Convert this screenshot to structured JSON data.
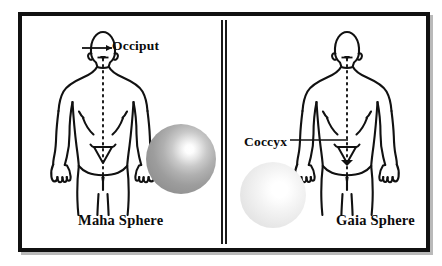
{
  "image": {
    "title": "Maha Sphere and Gaia Sphere anatomical reference",
    "background_color": "#ffffff",
    "frame_color": "#111111"
  },
  "panels": [
    {
      "id": "left",
      "caption": "Maha Sphere",
      "annotation": {
        "label": "Occiput",
        "icon": "leader-line-icon",
        "target": "base of skull / occiput"
      },
      "sphere": {
        "name": "maha-sphere",
        "tone": "medium gray",
        "fill_start": "#ffffff",
        "fill_end": "#8e8e8e",
        "highlight_position": "upper-right"
      },
      "figure": {
        "name": "human-back-figure",
        "view": "posterior",
        "midline": "dotted vertical spine line"
      }
    },
    {
      "id": "right",
      "caption": "Gaia Sphere",
      "annotation": {
        "label": "Coccyx",
        "icon": "leader-line-icon",
        "target": "sacrum / coccyx"
      },
      "sphere": {
        "name": "gaia-sphere",
        "tone": "pale light gray",
        "fill_start": "#ffffff",
        "fill_end": "#e1e1e1",
        "highlight_position": "center-right"
      },
      "figure": {
        "name": "human-back-figure",
        "view": "posterior",
        "midline": "dotted vertical spine line"
      }
    }
  ],
  "divider": {
    "name": "panel-divider",
    "style": "double vertical rule",
    "color": "#1a1a1a"
  }
}
